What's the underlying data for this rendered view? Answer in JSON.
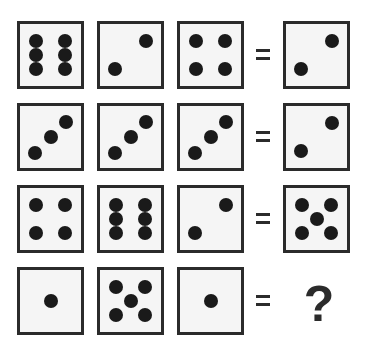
{
  "puzzle": {
    "rows": [
      {
        "dice": [
          6,
          2,
          4
        ],
        "result": 2
      },
      {
        "dice": [
          3,
          3,
          3
        ],
        "result": 2
      },
      {
        "dice": [
          4,
          6,
          2
        ],
        "result": 5
      },
      {
        "dice": [
          1,
          5,
          1
        ],
        "result": null
      }
    ],
    "equals_symbol": "=",
    "unknown_symbol": "?"
  },
  "colors": {
    "border": "#2b2b2b",
    "face": "#f5f5f5",
    "pip": "#1a1a1a"
  }
}
